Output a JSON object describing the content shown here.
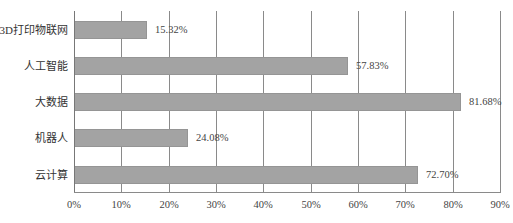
{
  "chart_data": {
    "type": "bar",
    "orientation": "horizontal",
    "title": "",
    "xlabel": "",
    "ylabel": "",
    "categories": [
      "3D打印物联网",
      "人工智能",
      "大数据",
      "机器人",
      "云计算"
    ],
    "values": [
      15.32,
      57.83,
      81.68,
      24.08,
      72.7
    ],
    "value_labels": [
      "15.32%",
      "57.83%",
      "81.68%",
      "24.08%",
      "72.70%"
    ],
    "xlim": [
      0,
      90
    ],
    "x_ticks": [
      "0%",
      "10%",
      "20%",
      "30%",
      "40%",
      "50%",
      "60%",
      "70%",
      "80%",
      "90%"
    ],
    "grid": "vertical",
    "legend": "none",
    "colors": {
      "bar": "#a3a3a3",
      "grid": "#8a8a8a"
    }
  }
}
